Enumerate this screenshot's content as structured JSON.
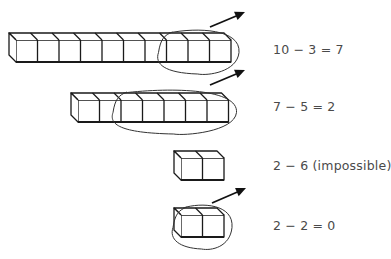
{
  "rows": [
    {
      "cubes": 10,
      "front_x": 16,
      "top_y": 40,
      "circled_from": 7,
      "circled_count": 3,
      "arrow": [
        210,
        27,
        245,
        12
      ],
      "equation": "10 − 3 = 7",
      "eq_y": 42
    },
    {
      "cubes": 7,
      "front_x": 78,
      "top_y": 100,
      "circled_from": 2,
      "circled_count": 5,
      "arrow": [
        210,
        85,
        245,
        70
      ],
      "equation": "7 − 5 = 2",
      "eq_y": 99
    },
    {
      "cubes": 2,
      "front_x": 181,
      "top_y": 158,
      "circled_from": null,
      "circled_count": 0,
      "arrow": null,
      "equation": "2 − 6 (impossible)",
      "eq_y": 158
    },
    {
      "cubes": 2,
      "front_x": 181,
      "top_y": 215,
      "circled_from": 0,
      "circled_count": 2,
      "arrow": [
        212,
        203,
        246,
        188
      ],
      "equation": "2 − 2 = 0",
      "eq_y": 218
    }
  ],
  "style": {
    "stroke": "#1a1a1a",
    "text_color": "#4a4a4a",
    "cube_width": 21.5,
    "cube_height": 22,
    "depth": 7
  }
}
